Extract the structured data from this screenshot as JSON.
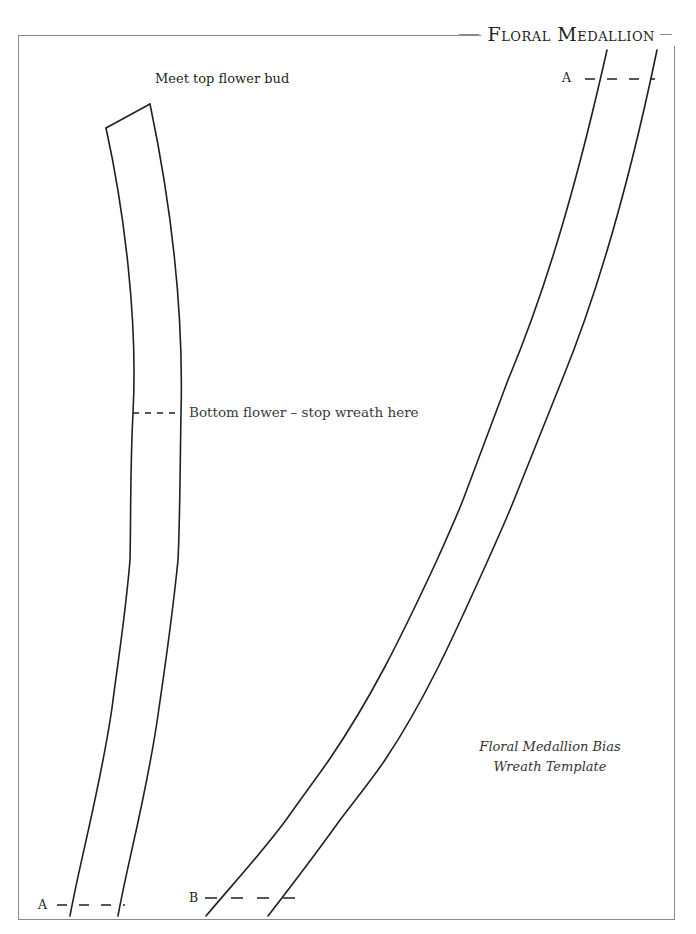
{
  "document": {
    "title": "Floral Medallion",
    "caption": {
      "line1": "Floral Medallion Bias",
      "line2": "Wreath Template"
    },
    "labels": {
      "top_bud": "Meet top flower bud",
      "bottom_flower": "Bottom flower – stop wreath here",
      "marker_a_top": "A",
      "marker_a_bottom": "A",
      "marker_b": "B"
    },
    "colors": {
      "ink": "#231f20",
      "frame": "#8a8a8a",
      "background": "#ffffff"
    }
  }
}
